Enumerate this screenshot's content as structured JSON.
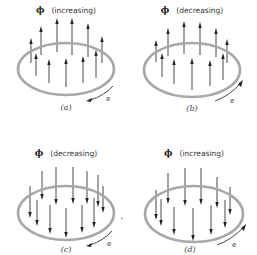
{
  "colors": {
    "background": "#ffffff",
    "ring": "#a8a8a8",
    "arrow": "#333333",
    "text": "#333333"
  },
  "panels": [
    {
      "id": "a",
      "symbol": "ϕ",
      "title": "(increasing)",
      "label": "(a)",
      "current_label": "e",
      "field_direction": "up",
      "current_direction": "clockwise-viewed-from-above"
    },
    {
      "id": "b",
      "symbol": "ϕ",
      "title": "(decreasing)",
      "label": "(b)",
      "current_label": "e",
      "field_direction": "up",
      "current_direction": "counterclockwise-viewed-from-above"
    },
    {
      "id": "c",
      "symbol": "ϕ",
      "title": "(decreasing)",
      "label": "(c)",
      "current_label": "e",
      "field_direction": "down",
      "current_direction": "clockwise-viewed-from-above"
    },
    {
      "id": "d",
      "symbol": "ϕ",
      "title": "(increasing)",
      "label": "(d)",
      "current_label": "e",
      "field_direction": "down",
      "current_direction": "counterclockwise-viewed-from-above"
    }
  ]
}
